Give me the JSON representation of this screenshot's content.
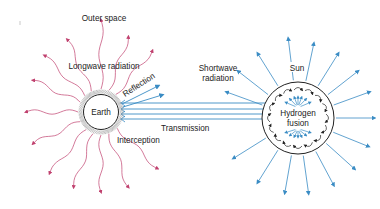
{
  "diagram": {
    "labels": {
      "outer_space": "Outer space",
      "longwave_radiation": "Longwave radiation",
      "reflection": "Reflection",
      "earth": "Earth",
      "interception": "Interception",
      "transmission": "Transmission",
      "shortwave_line1": "Shortwave",
      "shortwave_line2": "radiation",
      "sun": "Sun",
      "hydrogen": "Hydrogen",
      "fusion": "fusion"
    },
    "colors": {
      "longwave": "#c0406e",
      "shortwave": "#3a8cc4",
      "outline": "#222222",
      "hatch": "#9a9a9a",
      "background": "#ffffff"
    },
    "nodes": [
      {
        "id": "earth",
        "label": "Earth"
      },
      {
        "id": "sun",
        "label": "Sun",
        "inner_label": "Hydrogen fusion"
      },
      {
        "id": "outer_space",
        "label": "Outer space"
      }
    ],
    "edges": [
      {
        "from": "sun",
        "to": "earth",
        "label": "Transmission",
        "type": "shortwave"
      },
      {
        "from": "earth",
        "to": "outer_space",
        "label": "Longwave radiation",
        "type": "longwave"
      },
      {
        "from": "earth",
        "to": "outer_space",
        "label": "Reflection",
        "type": "shortwave"
      },
      {
        "from": "sun",
        "to": "outer_space",
        "label": "Shortwave radiation",
        "type": "shortwave"
      },
      {
        "from": "earth",
        "to": "earth",
        "label": "Interception"
      }
    ]
  }
}
